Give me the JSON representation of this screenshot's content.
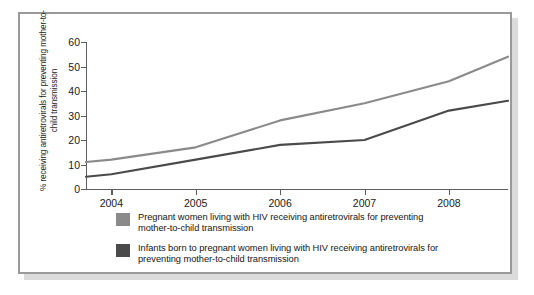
{
  "chart_data": {
    "type": "line",
    "title": "",
    "subtitle": "",
    "xlabel": "",
    "ylabel": "% receiving antiretrovirals for preventing mother-to-child transmission",
    "x": [
      2003.7,
      2004,
      2005,
      2006,
      2007,
      2008,
      2008.7
    ],
    "tick_labels_x": [
      "2004",
      "2005",
      "2006",
      "2007",
      "2008"
    ],
    "tick_values_x": [
      2004,
      2005,
      2006,
      2007,
      2008
    ],
    "tick_labels_y": [
      "0",
      "10",
      "20",
      "30",
      "40",
      "50",
      "60"
    ],
    "tick_values_y": [
      0,
      10,
      20,
      30,
      40,
      50,
      60
    ],
    "xlim": [
      2003.7,
      2008.7
    ],
    "ylim": [
      0,
      60
    ],
    "grid": false,
    "legend_position": "bottom-left",
    "series": [
      {
        "name": "Pregnant women living with HIV receiving antiretrovirals for preventing mother-to-child transmission",
        "color": "#8a8a8a",
        "values": [
          11,
          12,
          17,
          28,
          35,
          44,
          54
        ]
      },
      {
        "name": "Infants born to pregnant women living with HIV receiving antiretrovirals for preventing mother-to-child transmission",
        "color": "#4a4a4a",
        "values": [
          5,
          6,
          12,
          18,
          20,
          32,
          36
        ]
      }
    ]
  },
  "axis": {
    "y_title": "% receiving antiretrovirals for preventing mother-to-child transmission"
  },
  "legend": {
    "items": [
      {
        "label": "Pregnant women living with HIV receiving antiretrovirals for preventing mother-to-child transmission",
        "color": "#8a8a8a"
      },
      {
        "label": "Infants born to pregnant women living with HIV receiving antiretrovirals for preventing mother-to-child transmission",
        "color": "#4a4a4a"
      }
    ]
  }
}
